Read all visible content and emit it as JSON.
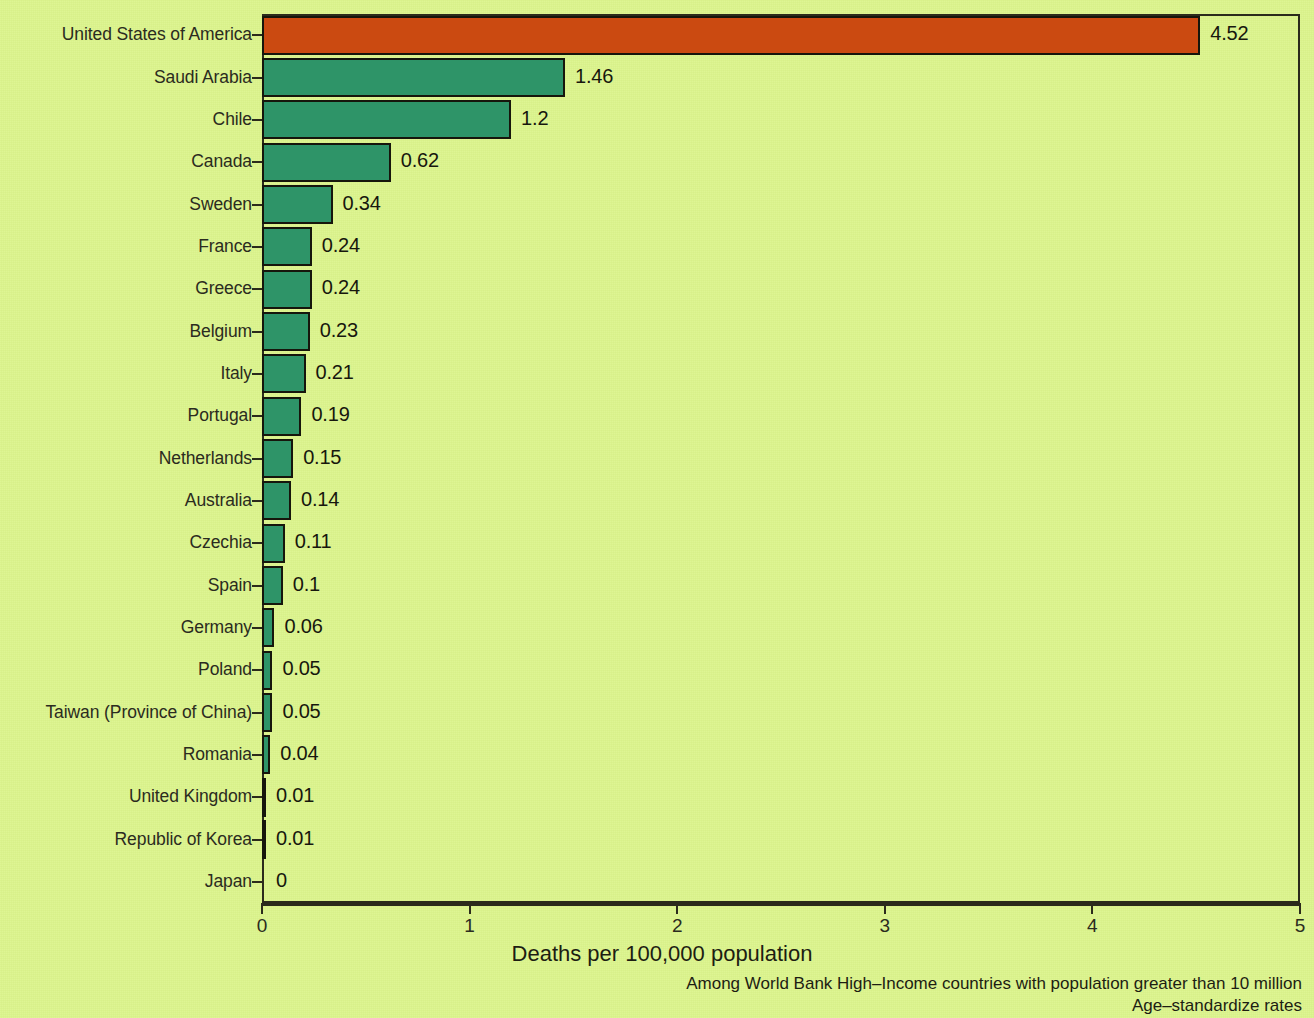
{
  "chart_data": {
    "type": "bar",
    "orientation": "horizontal",
    "title": "",
    "xlabel": "Deaths per 100,000 population",
    "ylabel": "",
    "xlim": [
      0,
      5
    ],
    "xticks": [
      0,
      1,
      2,
      3,
      4,
      5
    ],
    "xtick_labels": [
      "0",
      "1",
      "2",
      "3",
      "4",
      "5"
    ],
    "grid": false,
    "legend": "none",
    "categories": [
      "United States of America",
      "Saudi Arabia",
      "Chile",
      "Canada",
      "Sweden",
      "France",
      "Greece",
      "Belgium",
      "Italy",
      "Portugal",
      "Netherlands",
      "Australia",
      "Czechia",
      "Spain",
      "Germany",
      "Poland",
      "Taiwan (Province of China)",
      "Romania",
      "United Kingdom",
      "Republic of Korea",
      "Japan"
    ],
    "values": [
      4.52,
      1.46,
      1.2,
      0.62,
      0.34,
      0.24,
      0.24,
      0.23,
      0.21,
      0.19,
      0.15,
      0.14,
      0.11,
      0.1,
      0.06,
      0.05,
      0.05,
      0.04,
      0.01,
      0.01,
      0
    ],
    "value_labels": [
      "4.52",
      "1.46",
      "1.2",
      "0.62",
      "0.34",
      "0.24",
      "0.24",
      "0.23",
      "0.21",
      "0.19",
      "0.15",
      "0.14",
      "0.11",
      "0.1",
      "0.06",
      "0.05",
      "0.05",
      "0.04",
      "0.01",
      "0.01",
      "0"
    ],
    "highlight_index": 0,
    "annotations": [
      "Among World Bank High–Income countries with population greater than 10 million",
      "Age–standardize rates"
    ]
  },
  "colors": {
    "background": "#dcf58c",
    "bar": "#2e9468",
    "bar_highlight": "#cb4a11",
    "bar_border": "#16160c",
    "axis": "#2b2b1c",
    "text": "#1d1d12"
  },
  "notes": {
    "line1": "Among World Bank High–Income countries with population greater than 10 million",
    "line2": "Age–standardize rates"
  },
  "axis": {
    "x_title": "Deaths per 100,000 population"
  }
}
